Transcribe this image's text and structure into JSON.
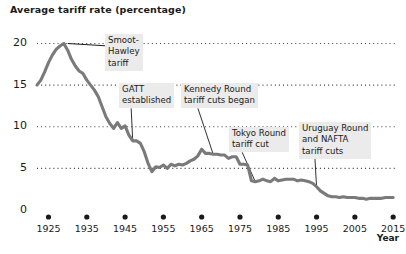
{
  "chart_data": {
    "type": "line",
    "title": "Average tariff rate (percentage)",
    "xlabel": "Year",
    "ylabel": "",
    "xlim": [
      1922,
      2016
    ],
    "ylim": [
      0,
      21.5
    ],
    "grid": true,
    "grid_style": "dotted-horizontal",
    "legend": null,
    "line_color": "#7a7a7a",
    "series_name": "Average tariff rate",
    "y_ticks": [
      "0",
      "5",
      "10",
      "15",
      "20"
    ],
    "y_tick_values": [
      0,
      5,
      10,
      15,
      20
    ],
    "x_ticks": [
      "1925",
      "1935",
      "1945",
      "1955",
      "1965",
      "1975",
      "1985",
      "1995",
      "2005",
      "2015"
    ],
    "x_tick_values": [
      1925,
      1935,
      1945,
      1955,
      1965,
      1975,
      1985,
      1995,
      2005,
      2015
    ],
    "x": [
      1922,
      1923,
      1924,
      1925,
      1926,
      1927,
      1928,
      1929,
      1930,
      1931,
      1932,
      1933,
      1934,
      1935,
      1936,
      1937,
      1938,
      1939,
      1940,
      1941,
      1942,
      1943,
      1944,
      1945,
      1946,
      1947,
      1948,
      1949,
      1950,
      1951,
      1952,
      1953,
      1954,
      1955,
      1956,
      1957,
      1958,
      1959,
      1960,
      1961,
      1962,
      1963,
      1964,
      1965,
      1966,
      1967,
      1968,
      1969,
      1970,
      1971,
      1972,
      1973,
      1974,
      1975,
      1976,
      1977,
      1978,
      1979,
      1980,
      1981,
      1982,
      1983,
      1984,
      1985,
      1986,
      1987,
      1988,
      1989,
      1990,
      1991,
      1992,
      1993,
      1994,
      1995,
      1996,
      1997,
      1998,
      1999,
      2000,
      2001,
      2002,
      2003,
      2004,
      2005,
      2006,
      2007,
      2008,
      2009,
      2010,
      2011,
      2012,
      2013,
      2014,
      2015
    ],
    "y": [
      15.0,
      15.6,
      16.6,
      17.7,
      18.6,
      19.3,
      19.7,
      20.0,
      19.2,
      18.1,
      17.3,
      16.7,
      16.4,
      15.6,
      15.0,
      14.4,
      13.6,
      12.4,
      11.2,
      10.4,
      9.8,
      10.5,
      9.8,
      10.1,
      9.0,
      8.3,
      8.3,
      8.0,
      7.0,
      5.6,
      4.6,
      5.2,
      5.1,
      5.4,
      5.0,
      5.5,
      5.3,
      5.5,
      5.4,
      5.6,
      5.9,
      6.1,
      6.5,
      7.3,
      6.8,
      6.8,
      6.7,
      6.7,
      6.6,
      6.6,
      6.2,
      6.4,
      6.4,
      5.5,
      5.5,
      5.4,
      3.5,
      3.4,
      3.5,
      3.7,
      3.5,
      3.4,
      3.8,
      3.5,
      3.6,
      3.7,
      3.7,
      3.7,
      3.5,
      3.6,
      3.5,
      3.4,
      3.2,
      2.8,
      2.3,
      2.0,
      1.7,
      1.6,
      1.6,
      1.5,
      1.6,
      1.5,
      1.5,
      1.5,
      1.4,
      1.4,
      1.3,
      1.4,
      1.4,
      1.4,
      1.4,
      1.5,
      1.5,
      1.5
    ],
    "annotations": [
      {
        "id": "smoot-hawley",
        "text": "Smoot-\nHawley\ntariff",
        "year": 1930,
        "value": 20.0
      },
      {
        "id": "gatt",
        "text": "GATT\nestablished",
        "year": 1947,
        "value": 8.3
      },
      {
        "id": "kennedy-round",
        "text": "Kennedy Round\ntariff cuts began",
        "year": 1968,
        "value": 6.7
      },
      {
        "id": "tokyo-round",
        "text": "Tokyo Round\ntariff cut",
        "year": 1979,
        "value": 3.4
      },
      {
        "id": "uruguay-nafta",
        "text": "Uruguay Round\nand NAFTA\ntariff cuts",
        "year": 1995,
        "value": 2.8
      }
    ]
  },
  "annotation_boxes": [
    {
      "id": "smoot-hawley",
      "lines": [
        "Smoot-",
        "Hawley",
        "tariff"
      ],
      "left": 105,
      "top": 34
    },
    {
      "id": "gatt",
      "lines": [
        "GATT",
        "established"
      ],
      "left": 119,
      "top": 83
    },
    {
      "id": "kennedy-round",
      "lines": [
        "Kennedy Round",
        "tariff cuts began"
      ],
      "left": 181,
      "top": 83
    },
    {
      "id": "tokyo-round",
      "lines": [
        "Tokyo Round",
        "tariff cut"
      ],
      "left": 229,
      "top": 127
    },
    {
      "id": "uruguay-nafta",
      "lines": [
        "Uruguay Round",
        "and NAFTA",
        "tariff cuts"
      ],
      "left": 299,
      "top": 122
    }
  ]
}
